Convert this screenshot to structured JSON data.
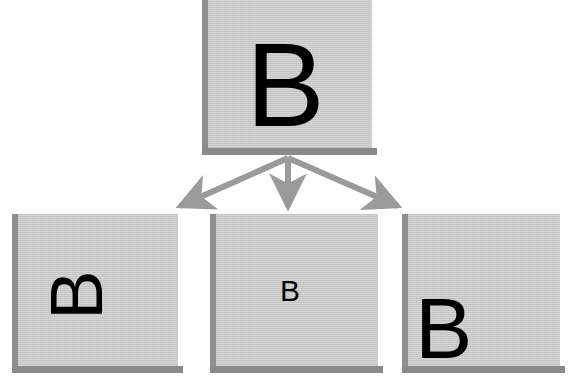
{
  "diagram": {
    "background_color": "#ffffff",
    "box_fill_color": "#c9c9c9",
    "box_edge_color": "#8a8a8a",
    "arrow_color": "#9a9a9a",
    "glyph_color": "#000000",
    "source": {
      "label": "B",
      "description": "source tile",
      "rotation_degrees": 0
    },
    "results": [
      {
        "label": "B",
        "description": "rotated result tile",
        "rotation_degrees": -90
      },
      {
        "label": "B",
        "description": "scaled-down result tile",
        "rotation_degrees": 0
      },
      {
        "label": "B",
        "description": "translated result tile",
        "rotation_degrees": 0
      }
    ],
    "arrows": [
      {
        "name": "arrow-to-left",
        "direction": "down-left"
      },
      {
        "name": "arrow-to-center",
        "direction": "down"
      },
      {
        "name": "arrow-to-right",
        "direction": "down-right"
      }
    ]
  }
}
